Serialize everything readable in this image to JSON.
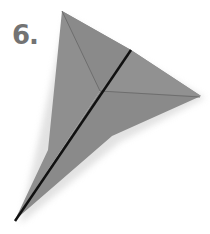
{
  "step": {
    "label": "6."
  },
  "illustration": {
    "name": "paper airplane fold",
    "colors": {
      "paper": "#8c8c8c",
      "paper_dark": "#7e7e7e",
      "fold_line": "#1a1a1a",
      "crease": "#6a6a6a",
      "shadow": "#d9d9d9"
    }
  }
}
